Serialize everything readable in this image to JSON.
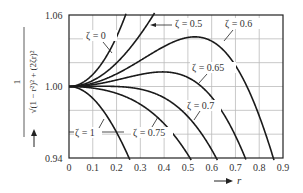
{
  "chart_data": {
    "type": "line",
    "title": "",
    "xlabel": "r",
    "ylabel": "1 / sqrt((1 - r^2)^2 + (2ζr)^2)",
    "xlim": [
      0,
      0.9
    ],
    "ylim": [
      0.94,
      1.06
    ],
    "x_ticks": [
      "0",
      "0.1",
      "0.2",
      "0.3",
      "0.4",
      "0.5",
      "0.6",
      "0.7",
      "0.8",
      "0.9"
    ],
    "y_ticks": [
      "0.94",
      "1.00",
      "1.06"
    ],
    "grid": true,
    "series": [
      {
        "name": "ζ = 0",
        "zeta": 0,
        "x": [
          0,
          0.1,
          0.2,
          0.23
        ],
        "y": [
          1.0,
          1.0101,
          1.0417,
          1.0559
        ]
      },
      {
        "name": "ζ = 0.5",
        "zeta": 0.5,
        "x": [
          0,
          0.1,
          0.2,
          0.3,
          0.35
        ],
        "y": [
          1.0,
          1.0,
          1.0008,
          1.0041,
          1.007
        ]
      },
      {
        "name": "ζ = 0.6",
        "zeta": 0.6,
        "x": [
          0,
          0.2,
          0.4,
          0.5,
          0.6,
          0.7,
          0.8,
          0.85
        ],
        "y": [
          1.0,
          0.9951,
          0.9874,
          0.9829,
          0.9778,
          0.9716,
          0.964,
          0.9596
        ]
      },
      {
        "name": "ζ = 0.65",
        "zeta": 0.65,
        "x": [
          0,
          0.2,
          0.4,
          0.6,
          0.75
        ],
        "y": [
          1.0,
          0.991,
          0.973,
          0.9504,
          0.9383
        ]
      },
      {
        "name": "ζ = 0.7",
        "zeta": 0.7,
        "x": [
          0,
          0.2,
          0.4,
          0.6
        ],
        "y": [
          1.0,
          0.9998,
          0.9995,
          0.9404
        ]
      },
      {
        "name": "ζ = 0.75",
        "zeta": 0.75,
        "x": [
          0,
          0.2,
          0.4,
          0.5
        ],
        "y": [
          1.0,
          0.995,
          0.97,
          0.94
        ]
      },
      {
        "name": "ζ = 1",
        "zeta": 1,
        "x": [
          0,
          0.1,
          0.2,
          0.25
        ],
        "y": [
          1.0,
          0.9901,
          0.9615,
          0.9412
        ]
      }
    ],
    "annotations": [
      "ζ = 0",
      "ζ = 0.5",
      "ζ = 0.6",
      "ζ = 0.65",
      "ζ = 0.7",
      "ζ = 0.75",
      "ζ = 1"
    ]
  },
  "labels": {
    "y_label_num": "1",
    "y_label_den": "√(1 − r²)² + (2ζr)²",
    "x_label": "r",
    "z0": "ζ = 0",
    "z05": "ζ = 0.5",
    "z06": "ζ = 0.6",
    "z065": "ζ = 0.65",
    "z07": "ζ = 0.7",
    "z075": "ζ = 0.75",
    "z1": "ζ = 1"
  },
  "zetas": [
    0,
    0.5,
    0.6,
    0.65,
    0.7,
    0.75,
    1
  ]
}
